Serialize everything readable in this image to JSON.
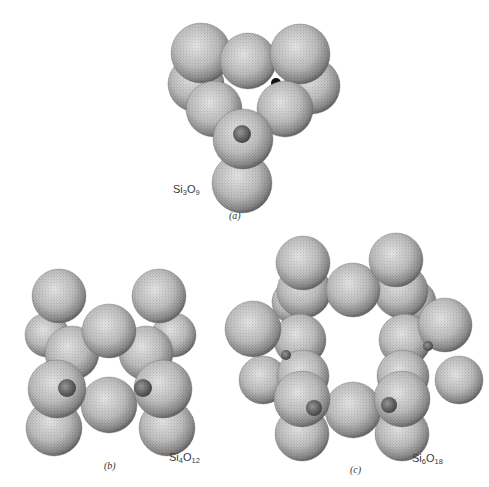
{
  "figure": {
    "panels": [
      {
        "id": "a",
        "label": "(a)",
        "label_pos": [
          229,
          210
        ],
        "formula": {
          "el1": "Si",
          "n1": "3",
          "el2": "O",
          "n2": "9",
          "pos": [
            173,
            183
          ]
        },
        "ring_size": 3,
        "spheres": [
          [
            196,
            84,
            28
          ],
          [
            312,
            86,
            28
          ],
          [
            201,
            53,
            30
          ],
          [
            248,
            61,
            28
          ],
          [
            300,
            54,
            30
          ],
          [
            214,
            109,
            28
          ],
          [
            285,
            109,
            28
          ],
          [
            242,
            183,
            30
          ],
          [
            243,
            139,
            30
          ]
        ],
        "silicon_atoms": [
          [
            242,
            134,
            9
          ]
        ],
        "dark_gaps": [
          [
            219,
            83,
            5
          ],
          [
            276,
            83,
            5
          ]
        ]
      },
      {
        "id": "b",
        "label": "(b)",
        "label_pos": [
          104,
          460
        ],
        "formula": {
          "el1": "Si",
          "n1": "4",
          "el2": "O",
          "n2": "12",
          "pos": [
            169,
            451
          ]
        },
        "ring_size": 4,
        "spheres": [
          [
            47,
            335,
            22
          ],
          [
            174,
            335,
            22
          ],
          [
            59,
            296,
            27
          ],
          [
            159,
            296,
            27
          ],
          [
            72,
            353,
            27
          ],
          [
            146,
            353,
            27
          ],
          [
            109,
            331,
            27
          ],
          [
            54,
            428,
            28
          ],
          [
            167,
            428,
            28
          ],
          [
            109,
            405,
            28
          ],
          [
            57,
            389,
            29
          ],
          [
            163,
            389,
            29
          ]
        ],
        "silicon_atoms": [
          [
            67,
            388,
            9
          ],
          [
            143,
            388,
            9
          ]
        ],
        "dark_gaps": [
          [
            81,
            331,
            3
          ],
          [
            139,
            331,
            3
          ]
        ]
      },
      {
        "id": "c",
        "label": "(c)",
        "label_pos": [
          350,
          464
        ],
        "formula": {
          "el1": "Si",
          "n1": "6",
          "el2": "O",
          "n2": "18",
          "pos": [
            412,
            452
          ]
        },
        "ring_size": 6,
        "spheres": [
          [
            294,
            302,
            22
          ],
          [
            414,
            302,
            22
          ],
          [
            263,
            380,
            24
          ],
          [
            459,
            380,
            24
          ],
          [
            304,
            291,
            27
          ],
          [
            401,
            291,
            27
          ],
          [
            300,
            340,
            26
          ],
          [
            405,
            340,
            26
          ],
          [
            253,
            329,
            28
          ],
          [
            445,
            325,
            27
          ],
          [
            303,
            376,
            26
          ],
          [
            403,
            376,
            26
          ],
          [
            302,
            434,
            27
          ],
          [
            402,
            434,
            27
          ],
          [
            353,
            290,
            27
          ],
          [
            303,
            263,
            27
          ],
          [
            396,
            260,
            27
          ],
          [
            353,
            410,
            28
          ],
          [
            302,
            399,
            28
          ],
          [
            402,
            399,
            28
          ]
        ],
        "silicon_atoms": [
          [
            314,
            408,
            8
          ],
          [
            389,
            405,
            8
          ],
          [
            286,
            355,
            5
          ],
          [
            428,
            346,
            5
          ]
        ],
        "dark_gaps": [
          [
            321,
            300,
            5
          ],
          [
            383,
            296,
            5
          ]
        ]
      }
    ]
  }
}
